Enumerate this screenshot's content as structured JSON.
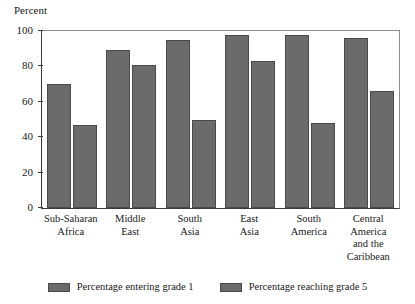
{
  "chart_data": {
    "type": "bar",
    "title": "",
    "subtitle": "",
    "xlabel": "",
    "ylabel": "Percent",
    "ylim": [
      0,
      100
    ],
    "yticks": [
      0,
      20,
      40,
      60,
      80,
      100
    ],
    "grid": false,
    "legend_position": "bottom",
    "orientation": "vertical",
    "grouping": "grouped",
    "categories": [
      "Sub-Saharan\nAfrica",
      "Middle\nEast",
      "South\nAsia",
      "East\nAsia",
      "South\nAmerica",
      "Central\nAmerica\nand the\nCaribbean"
    ],
    "series": [
      {
        "name": "Percentage entering grade 1",
        "color": "#6b6b6b",
        "values": [
          70,
          89,
          95,
          98,
          98,
          96
        ]
      },
      {
        "name": "Percentage reaching grade 5",
        "color": "#6b6b6b",
        "values": [
          47,
          81,
          50,
          83,
          48,
          66
        ]
      }
    ]
  },
  "axis": {
    "y_unit_label": "Percent"
  },
  "legend": {
    "items": [
      {
        "label": "Percentage entering grade 1"
      },
      {
        "label": "Percentage reaching grade 5"
      }
    ]
  }
}
